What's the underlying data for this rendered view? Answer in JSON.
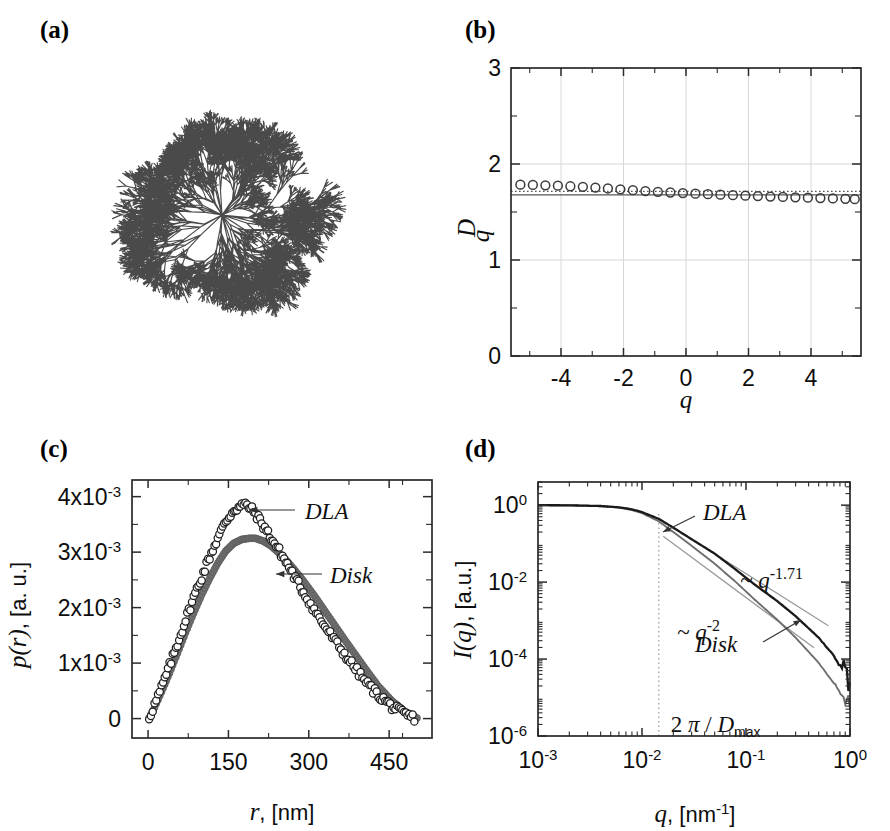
{
  "figure": {
    "panel_labels": {
      "a": "(a)",
      "b": "(b)",
      "c": "(c)",
      "d": "(d)"
    }
  },
  "panel_a": {
    "caption_label": "(a)",
    "description": "dla-cluster-image",
    "cluster_color": "#4a4a4a",
    "branches": 6
  },
  "chart_data": [
    {
      "id": "panel_b",
      "type": "scatter",
      "title": "",
      "xlabel": "q",
      "ylabel": "D_q",
      "xlim": [
        -5.6,
        5.6
      ],
      "ylim": [
        0,
        3
      ],
      "xticks": [
        -4,
        -2,
        0,
        2,
        4
      ],
      "xticklabels": [
        "-4",
        "-2",
        "0",
        "2",
        "4"
      ],
      "yticks": [
        0,
        1,
        2,
        3
      ],
      "yticklabels": [
        "0",
        "1",
        "2",
        "3"
      ],
      "grid": true,
      "legend": "none",
      "marker": "open-circle",
      "x": [
        -5.3,
        -4.9,
        -4.5,
        -4.1,
        -3.7,
        -3.3,
        -2.9,
        -2.5,
        -2.1,
        -1.7,
        -1.3,
        -0.9,
        -0.5,
        -0.1,
        0.3,
        0.7,
        1.1,
        1.5,
        1.9,
        2.3,
        2.7,
        3.1,
        3.5,
        3.9,
        4.3,
        4.7,
        5.1,
        5.4
      ],
      "values": [
        1.785,
        1.782,
        1.778,
        1.774,
        1.768,
        1.762,
        1.754,
        1.745,
        1.736,
        1.727,
        1.718,
        1.71,
        1.703,
        1.697,
        1.691,
        1.686,
        1.68,
        1.675,
        1.67,
        1.666,
        1.661,
        1.657,
        1.653,
        1.649,
        1.645,
        1.641,
        1.637,
        1.634
      ],
      "reference_lines": [
        {
          "name": "dotted-reference",
          "style": "dotted",
          "y": 1.715
        },
        {
          "name": "solid-reference",
          "style": "solid",
          "y": 1.678
        }
      ]
    },
    {
      "id": "panel_c",
      "type": "scatter",
      "title": "",
      "xlabel": "r",
      "xunits": ", [nm]",
      "ylabel": "p(r)",
      "yunits": ", [a. u.]",
      "xlim": [
        -30,
        530
      ],
      "ylim": [
        -0.00035,
        0.0043
      ],
      "xticks": [
        0,
        150,
        300,
        450
      ],
      "xticklabels": [
        "0",
        "150",
        "300",
        "450"
      ],
      "yticks": [
        0,
        0.001,
        0.002,
        0.003,
        0.004
      ],
      "yticklabels": [
        "0",
        "1x10-3",
        "2x10-3",
        "3x10-3",
        "4x10-3"
      ],
      "grid": false,
      "annotations": [
        {
          "text": "DLA",
          "target": "dla-curve"
        },
        {
          "text": "Disk",
          "target": "disk-curve"
        }
      ],
      "series": [
        {
          "name": "DLA",
          "marker": "open-circle",
          "color": "#1a1a1a",
          "peak_x": 185,
          "peak_y": 0.00385,
          "x_end": 500,
          "x": [
            2,
            12,
            25,
            40,
            55,
            70,
            85,
            100,
            115,
            130,
            145,
            160,
            175,
            185,
            200,
            215,
            230,
            245,
            260,
            275,
            290,
            310,
            330,
            350,
            370,
            390,
            410,
            430,
            455,
            478,
            497
          ],
          "values": [
            2e-05,
            0.00025,
            0.00055,
            0.00095,
            0.00135,
            0.00178,
            0.00218,
            0.00255,
            0.00292,
            0.00325,
            0.00355,
            0.00376,
            0.00384,
            0.00385,
            0.0037,
            0.00348,
            0.00325,
            0.00302,
            0.00278,
            0.00252,
            0.00228,
            0.00196,
            0.00166,
            0.00138,
            0.00112,
            0.00086,
            0.00062,
            0.00042,
            0.00022,
            8e-05,
            1e-05
          ]
        },
        {
          "name": "Disk",
          "marker": "filled-circle",
          "color": "#6e6e6e",
          "peak_x": 200,
          "peak_y": 0.00325,
          "x_end": 505,
          "x": [
            2,
            12,
            25,
            40,
            55,
            70,
            85,
            100,
            115,
            130,
            145,
            160,
            175,
            190,
            200,
            215,
            230,
            245,
            260,
            275,
            290,
            310,
            330,
            350,
            370,
            390,
            410,
            430,
            455,
            478,
            502
          ],
          "values": [
            1e-05,
            0.0002,
            0.00048,
            0.00082,
            0.00118,
            0.00155,
            0.0019,
            0.00223,
            0.00253,
            0.0028,
            0.00302,
            0.00316,
            0.00323,
            0.00325,
            0.00325,
            0.0032,
            0.00311,
            0.00298,
            0.00283,
            0.00266,
            0.00248,
            0.00222,
            0.00194,
            0.00166,
            0.00138,
            0.00111,
            0.00084,
            0.00058,
            0.00032,
            0.00013,
            1e-05
          ]
        }
      ]
    },
    {
      "id": "panel_d",
      "type": "line",
      "title": "",
      "xlabel": "q",
      "xunits": ", [nm-1]",
      "ylabel": "I(q)",
      "yunits": ", [a.u.]",
      "xscale": "log",
      "yscale": "log",
      "xlim": [
        0.001,
        1.0
      ],
      "ylim": [
        1e-06,
        4.0
      ],
      "xticks": [
        0.001,
        0.01,
        0.1,
        1.0
      ],
      "xticklabels": [
        "10-3",
        "10-2",
        "10-1",
        "100"
      ],
      "yticks": [
        1e-06,
        0.0001,
        0.01,
        1.0
      ],
      "yticklabels": [
        "10-6",
        "10-4",
        "10-2",
        "100"
      ],
      "grid": false,
      "annotations": [
        {
          "text": "DLA",
          "target": "dla-curve"
        },
        {
          "text": "Disk",
          "target": "disk-curve"
        },
        {
          "text": "~ q-1.71",
          "exponent": "-1.71",
          "target": "dla-slope-guide"
        },
        {
          "text": "~ q-2",
          "exponent": "-2",
          "target": "disk-slope-guide"
        },
        {
          "text": "2 p / Dmax",
          "target": "dotted-vertical-marker",
          "q_value": 0.0145
        }
      ],
      "vertical_marker": {
        "name": "2pi-over-Dmax",
        "q": 0.0145,
        "style": "dotted"
      },
      "series": [
        {
          "name": "DLA",
          "color": "#1a1a1a",
          "slope": -1.71,
          "x": [
            0.001,
            0.002,
            0.004,
            0.006,
            0.008,
            0.01,
            0.0145,
            0.02,
            0.03,
            0.05,
            0.08,
            0.12,
            0.2,
            0.3,
            0.5,
            0.7,
            0.9,
            1.0
          ],
          "values": [
            1.0,
            0.99,
            0.95,
            0.88,
            0.78,
            0.66,
            0.44,
            0.26,
            0.13,
            0.055,
            0.021,
            0.0088,
            0.0032,
            0.0013,
            0.00036,
            0.00012,
            4e-05,
            2.5e-05
          ]
        },
        {
          "name": "Disk",
          "color": "#6e6e6e",
          "slope": -2.0,
          "x": [
            0.001,
            0.002,
            0.004,
            0.006,
            0.008,
            0.01,
            0.0145,
            0.02,
            0.03,
            0.05,
            0.08,
            0.12,
            0.2,
            0.3,
            0.5,
            0.7,
            0.9,
            1.0
          ],
          "values": [
            1.0,
            0.99,
            0.94,
            0.86,
            0.75,
            0.62,
            0.38,
            0.2,
            0.088,
            0.03,
            0.01,
            0.0036,
            0.00105,
            0.00036,
            8e-05,
            2.4e-05,
            8.5e-06,
            5e-06
          ]
        }
      ]
    }
  ]
}
